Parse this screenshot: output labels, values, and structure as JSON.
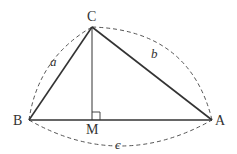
{
  "diagram": {
    "type": "geometry-triangle",
    "stroke_color": "#333333",
    "dash_color": "#555555",
    "vertices": {
      "C": {
        "label": "C",
        "x": 92,
        "y": 27
      },
      "B": {
        "label": "B",
        "x": 29,
        "y": 120
      },
      "A": {
        "label": "A",
        "x": 212,
        "y": 120
      },
      "M": {
        "label": "M",
        "x": 92,
        "y": 120
      }
    },
    "sides": {
      "a": {
        "label": "a",
        "between": [
          "B",
          "C"
        ]
      },
      "b": {
        "label": "b",
        "between": [
          "C",
          "A"
        ]
      },
      "c": {
        "label": "c",
        "between": [
          "B",
          "A"
        ]
      }
    },
    "annotations": {
      "altitude": "CM perpendicular to BA",
      "right_angle_at": "M"
    }
  }
}
